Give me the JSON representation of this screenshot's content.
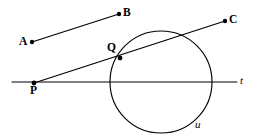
{
  "figure": {
    "width": 258,
    "height": 140,
    "background_color": "#ffffff",
    "stroke_color": "#000000"
  },
  "labels": {
    "A": "A",
    "B": "B",
    "C": "C",
    "P": "P",
    "Q": "Q",
    "t": "t",
    "u": "u"
  },
  "geometry": {
    "line_t": {
      "name": "t",
      "type": "line",
      "x1": 12,
      "y1": 82,
      "x2": 237,
      "y2": 82
    },
    "circle_u": {
      "name": "u",
      "type": "circle",
      "cx": 161,
      "cy": 82,
      "r": 51
    },
    "segment_AB": {
      "name": "AB",
      "type": "segment",
      "x1": 32,
      "y1": 42,
      "x2": 119,
      "y2": 14
    },
    "line_PC": {
      "name": "PC",
      "type": "segment",
      "x1": 34,
      "y1": 83,
      "x2": 225,
      "y2": 21
    },
    "points": [
      {
        "id": "A",
        "x": 32,
        "y": 42
      },
      {
        "id": "B",
        "x": 119,
        "y": 14
      },
      {
        "id": "C",
        "x": 225,
        "y": 21
      },
      {
        "id": "Q",
        "x": 120,
        "y": 58
      },
      {
        "id": "P",
        "x": 34,
        "y": 83
      }
    ]
  }
}
